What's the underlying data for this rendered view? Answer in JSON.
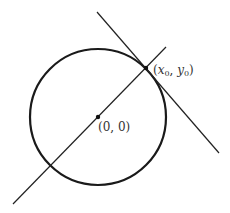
{
  "diagram": {
    "circle": {
      "cx": 98,
      "cy": 117,
      "r": 68,
      "stroke": "#1a1a1a",
      "stroke_width": 2.2
    },
    "radial_line": {
      "x1": 13,
      "y1": 204,
      "x2": 166,
      "y2": 47,
      "stroke": "#222222"
    },
    "tangent_line": {
      "x1": 97,
      "y1": 12,
      "x2": 219,
      "y2": 153,
      "stroke": "#222222"
    },
    "points": [
      {
        "name": "origin",
        "x": 98,
        "y": 117,
        "label": "(0,0)"
      },
      {
        "name": "tangent-point",
        "x": 146,
        "y": 68,
        "label": "(x0,y0)"
      }
    ],
    "labels": {
      "origin": "(0, 0)",
      "tangent_point_open": "(",
      "tangent_point_x": "x",
      "tangent_point_x_sub": "0",
      "tangent_point_sep": ", ",
      "tangent_point_y": "y",
      "tangent_point_y_sub": "0",
      "tangent_point_close": ")"
    }
  }
}
